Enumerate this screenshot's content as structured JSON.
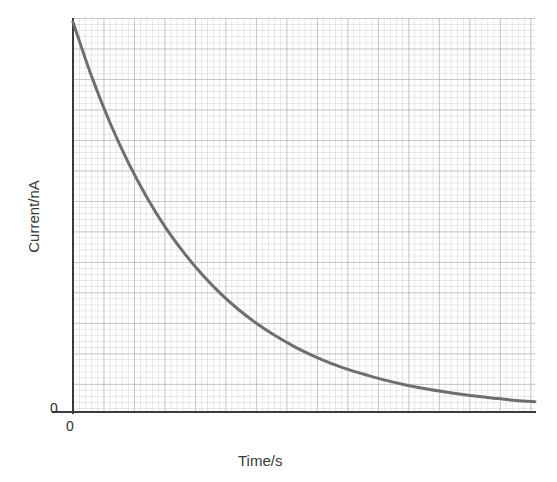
{
  "chart_data": {
    "type": "line",
    "title": "",
    "subtitle": "",
    "xlabel": "Time/s",
    "ylabel": "Current/nA",
    "x_tick_labels": [
      "0"
    ],
    "y_tick_labels": [
      "0"
    ],
    "xlim": [
      0,
      1
    ],
    "ylim": [
      0,
      1
    ],
    "grid": true,
    "grid_style": "graph-paper, fine minor squares with stronger major lines",
    "legend": null,
    "legend_position": "none",
    "annotations": [],
    "series": [
      {
        "name": "current decay",
        "description": "Exponential decay of current with time, starting at maximum at t=0 and asymptotically approaching zero",
        "color": "#6e6e6e",
        "line_width": 3,
        "x": [
          0.0,
          0.04,
          0.08,
          0.12,
          0.16,
          0.2,
          0.24,
          0.28,
          0.32,
          0.36,
          0.4,
          0.44,
          0.48,
          0.52,
          0.56,
          0.6,
          0.64,
          0.68,
          0.72,
          0.76,
          0.8,
          0.84,
          0.88,
          0.92,
          0.96,
          1.0
        ],
        "y": [
          1.0,
          0.861,
          0.741,
          0.638,
          0.549,
          0.472,
          0.407,
          0.35,
          0.301,
          0.259,
          0.223,
          0.192,
          0.165,
          0.142,
          0.122,
          0.105,
          0.091,
          0.078,
          0.067,
          0.058,
          0.05,
          0.043,
          0.037,
          0.032,
          0.027,
          0.024
        ]
      }
    ]
  },
  "axes": {
    "y_label": "Current/nA",
    "x_label": "Time/s",
    "y_origin_label": "0",
    "x_origin_label": "0",
    "axis_color": "#3b3b3b"
  },
  "colors": {
    "background": "#ffffff",
    "curve": "#6e6e6e",
    "axis": "#3b3b3b",
    "grid_minor": "#acacb2",
    "grid_major": "#96969e",
    "text": "#3a3a3a"
  }
}
